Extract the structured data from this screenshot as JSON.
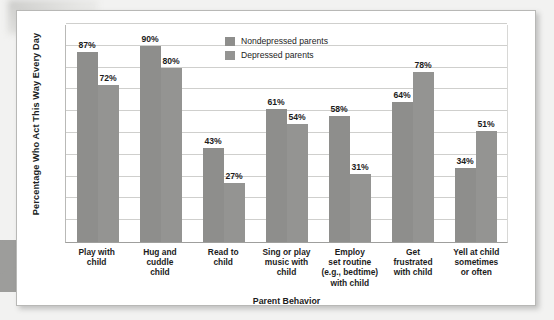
{
  "chart_data": {
    "type": "bar",
    "title": "",
    "xlabel": "Parent Behavior",
    "ylabel": "Percentage Who Act This Way Every Day",
    "ylim": [
      0,
      100
    ],
    "grid": true,
    "legend_position": "top-center",
    "categories": [
      "Play with child",
      "Hug and cuddle child",
      "Read to child",
      "Sing or play music with child",
      "Employ set routine (e.g., bedtime) with child",
      "Get frustrated with child",
      "Yell at child sometimes or often"
    ],
    "category_lines": [
      [
        "Play with",
        "child"
      ],
      [
        "Hug and",
        "cuddle",
        "child"
      ],
      [
        "Read to",
        "child"
      ],
      [
        "Sing or play",
        "music with",
        "child"
      ],
      [
        "Employ",
        "set routine",
        "(e.g., bedtime)",
        "with child"
      ],
      [
        "Get",
        "frustrated",
        "with child"
      ],
      [
        "Yell at child",
        "sometimes",
        "or often"
      ]
    ],
    "series": [
      {
        "name": "Nondepressed parents",
        "color": "#8e8e8c",
        "values": [
          87,
          90,
          43,
          61,
          58,
          64,
          34
        ],
        "value_labels": [
          "87%",
          "90%",
          "43%",
          "61%",
          "58%",
          "64%",
          "34%"
        ]
      },
      {
        "name": "Depressed parents",
        "color": "#949492",
        "values": [
          72,
          80,
          27,
          54,
          31,
          78,
          51
        ],
        "value_labels": [
          "72%",
          "80%",
          "27%",
          "54%",
          "31%",
          "78%",
          "51%"
        ]
      }
    ],
    "gridline_values": [
      10,
      20,
      30,
      40,
      50,
      60,
      70,
      80,
      90,
      100
    ]
  },
  "legend": {
    "items": [
      {
        "label": "Nondepressed parents"
      },
      {
        "label": "Depressed parents"
      }
    ]
  }
}
